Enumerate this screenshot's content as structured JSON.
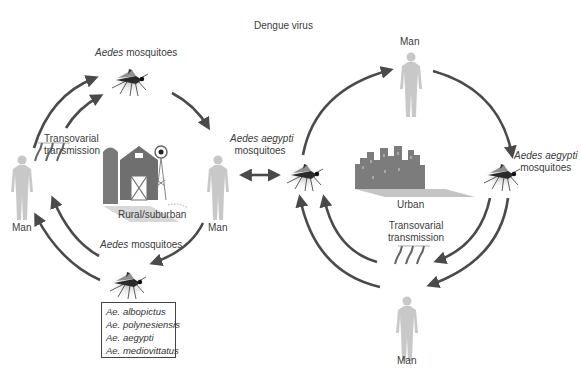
{
  "title": "Dengue virus",
  "sylvatic_cycle": {
    "setting_label": "Rural/suburban",
    "top_vector": {
      "genus": "Aedes",
      "rest": " mosquitoes"
    },
    "bottom_vector": {
      "genus": "Aedes",
      "rest": " mosquitoes"
    },
    "left_host": "Man",
    "right_host": "Man",
    "transovarial": [
      "Transovarial",
      "transmission"
    ],
    "species_box": [
      "Ae. albopictus",
      "Ae. polynesiensis",
      "Ae. aegypti",
      "Ae. mediovittatus"
    ]
  },
  "link_vector": {
    "genus": "Aedes aegypti",
    "rest": "mosquitoes"
  },
  "urban_cycle": {
    "setting_label": "Urban",
    "top_host": "Man",
    "bottom_host": "Man",
    "right_vector": {
      "genus": "Aedes aegypti",
      "rest": "mosquitoes"
    },
    "transovarial": [
      "Transovarial",
      "transmission"
    ]
  },
  "colors": {
    "arrow": "#4a4a4a",
    "human": "#c8c8c8",
    "building": "#7a7a7a",
    "text": "#3c3c3c"
  }
}
